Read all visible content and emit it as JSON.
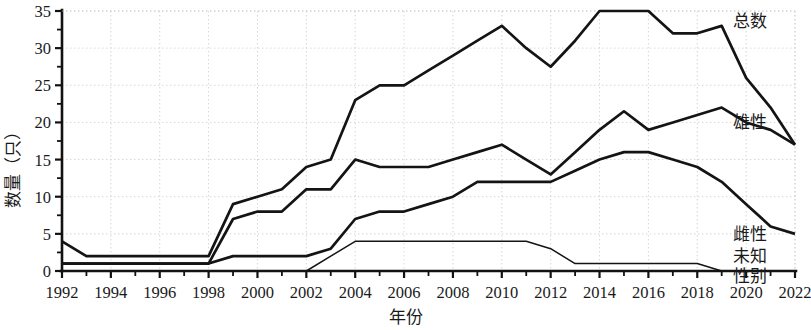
{
  "chart_data": {
    "type": "line",
    "title": "",
    "xlabel": "年份",
    "ylabel": "数量（只）",
    "xlim": [
      1992,
      2022
    ],
    "ylim": [
      0,
      35
    ],
    "ytick_step": 5,
    "ytick_minor_step": 2.5,
    "xtick_step": 2,
    "xtick_minor_step": 1,
    "grid": true,
    "legend_position": "right-inline",
    "x": [
      1992,
      1993,
      1994,
      1995,
      1996,
      1997,
      1998,
      1999,
      2000,
      2001,
      2002,
      2003,
      2004,
      2005,
      2006,
      2007,
      2008,
      2009,
      2010,
      2011,
      2012,
      2013,
      2014,
      2015,
      2016,
      2017,
      2018,
      2019,
      2020,
      2021,
      2022
    ],
    "xtick_labels": [
      "1992",
      "1994",
      "1996",
      "1998",
      "2000",
      "2002",
      "2004",
      "2006",
      "2008",
      "2010",
      "2012",
      "2014",
      "2016",
      "2018",
      "2020",
      "2022"
    ],
    "ytick_labels": [
      "0",
      "5",
      "10",
      "15",
      "20",
      "25",
      "30",
      "35"
    ],
    "series": [
      {
        "name": "总数",
        "label": "总数",
        "color": "#141414",
        "values": [
          4,
          2,
          2,
          2,
          2,
          2,
          2,
          9,
          10,
          11,
          14,
          15,
          23,
          25,
          25,
          27,
          29,
          31,
          33,
          30,
          27.5,
          31,
          35,
          35,
          35,
          32,
          32,
          33,
          26,
          22,
          17
        ]
      },
      {
        "name": "雄性",
        "label": "雄性",
        "color": "#141414",
        "values": [
          1,
          1,
          1,
          1,
          1,
          1,
          1,
          7,
          8,
          8,
          11,
          11,
          15,
          14,
          14,
          14,
          15,
          16,
          17,
          15,
          13,
          16,
          19,
          21.5,
          19,
          20,
          21,
          22,
          20,
          19,
          17
        ]
      },
      {
        "name": "雌性",
        "label": "雌性",
        "color": "#141414",
        "values": [
          1,
          1,
          1,
          1,
          1,
          1,
          1,
          2,
          2,
          2,
          2,
          3,
          7,
          8,
          8,
          9,
          10,
          12,
          12,
          12,
          12,
          13.5,
          15,
          16,
          16,
          15,
          14,
          12,
          9,
          6,
          5
        ]
      },
      {
        "name": "未知性别",
        "label": "未知 性别",
        "label_lines": [
          "未知",
          "性别"
        ],
        "color": "#141414",
        "thin": true,
        "values": [
          0,
          0,
          0,
          0,
          0,
          0,
          0,
          0,
          0,
          0,
          0,
          2,
          4,
          4,
          4,
          4,
          4,
          4,
          4,
          4,
          3,
          1,
          1,
          1,
          1,
          1,
          1,
          0,
          0,
          0,
          0
        ]
      }
    ]
  },
  "labels": {
    "y_axis_title": "数量（只）",
    "x_axis_title": "年份"
  }
}
